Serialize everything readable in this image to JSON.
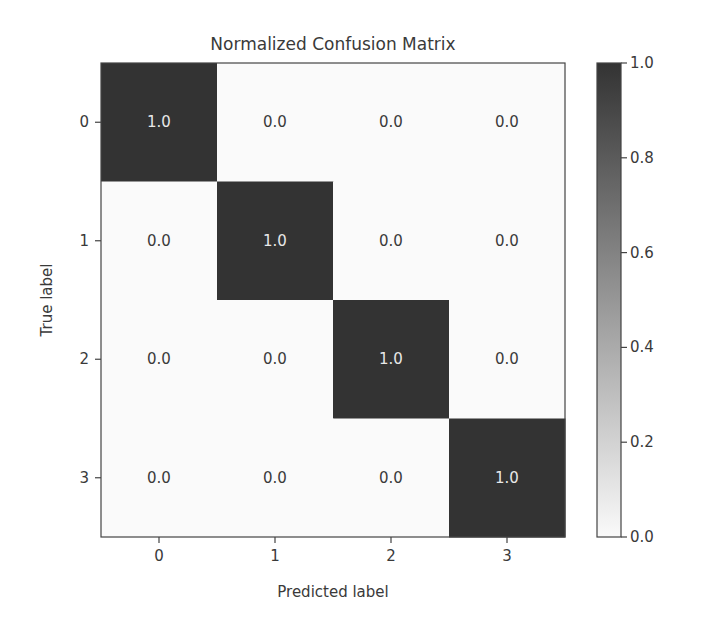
{
  "chart_data": {
    "type": "heatmap",
    "title": "Normalized Confusion Matrix",
    "xlabel": "Predicted label",
    "ylabel": "True label",
    "x_categories": [
      "0",
      "1",
      "2",
      "3"
    ],
    "y_categories": [
      "0",
      "1",
      "2",
      "3"
    ],
    "values": [
      [
        1.0,
        0.0,
        0.0,
        0.0
      ],
      [
        0.0,
        1.0,
        0.0,
        0.0
      ],
      [
        0.0,
        0.0,
        1.0,
        0.0
      ],
      [
        0.0,
        0.0,
        0.0,
        1.0
      ]
    ],
    "value_labels": [
      [
        "1.0",
        "0.0",
        "0.0",
        "0.0"
      ],
      [
        "0.0",
        "1.0",
        "0.0",
        "0.0"
      ],
      [
        "0.0",
        "0.0",
        "1.0",
        "0.0"
      ],
      [
        "0.0",
        "0.0",
        "0.0",
        "1.0"
      ]
    ],
    "colormap": "Greys",
    "color_low": "#fafafa",
    "color_high": "#333333",
    "text_color_on_dark": "#e8e8e8",
    "text_color_on_light": "#3a3a3a",
    "colorbar": {
      "range": [
        0.0,
        1.0
      ],
      "ticks": [
        0.0,
        0.2,
        0.4,
        0.6,
        0.8,
        1.0
      ],
      "tick_labels": [
        "0.0",
        "0.2",
        "0.4",
        "0.6",
        "0.8",
        "1.0"
      ],
      "placement": "right"
    },
    "grid": false
  }
}
